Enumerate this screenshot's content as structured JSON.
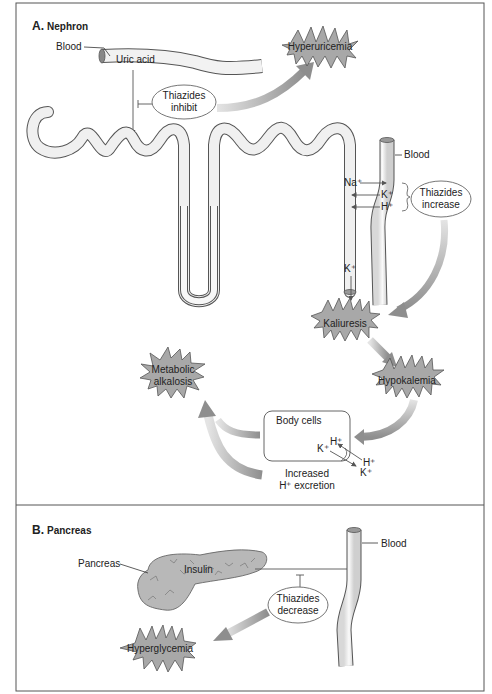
{
  "panels": [
    {
      "id": "A",
      "letter": "A.",
      "title": "Nephron",
      "labels": {
        "blood_top": "Blood",
        "uric_acid": "Uric acid",
        "thiazides_inhibit_1": "Thiazides",
        "thiazides_inhibit_2": "inhibit",
        "blood_right": "Blood",
        "na": "Na⁺",
        "k_exchange": "K⁺",
        "h_exchange": "H⁺",
        "thiazides_increase_1": "Thiazides",
        "thiazides_increase_2": "increase",
        "k_lumen": "K⁺",
        "body_cells": "Body cells",
        "cell_h": "H⁺",
        "cell_k": "K⁺",
        "out_h": "H⁺",
        "out_k": "K⁺",
        "increased_1": "Increased",
        "increased_2": "H⁺ excretion"
      },
      "effects": {
        "hyperuricemia": "Hyperuricemia",
        "kaliuresis": "Kaliuresis",
        "hypokalemia": "Hypokalemia",
        "metabolic_1": "Metabolic",
        "metabolic_2": "alkalosis"
      }
    },
    {
      "id": "B",
      "letter": "B.",
      "title": "Pancreas",
      "labels": {
        "pancreas": "Pancreas",
        "insulin": "Insulin",
        "blood": "Blood",
        "thiazides_decrease_1": "Thiazides",
        "thiazides_decrease_2": "decrease"
      },
      "effects": {
        "hyperglycemia": "Hyperglycemia"
      }
    }
  ],
  "colors": {
    "frame": "#555555",
    "tube_fill": "#f0f0f0",
    "tube_stroke": "#555555",
    "burst_fill": "#a8a8a8",
    "arrow_gray": "#a0a0a0",
    "pancreas_fill": "#b8b8b8"
  }
}
